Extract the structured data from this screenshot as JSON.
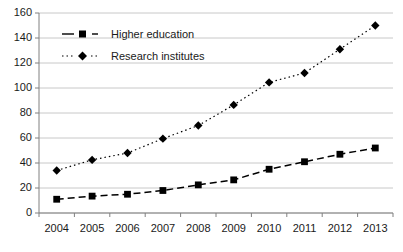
{
  "chart_data": {
    "type": "line",
    "title": "",
    "xlabel": "",
    "ylabel": "",
    "categories": [
      "2004",
      "2005",
      "2006",
      "2007",
      "2008",
      "2009",
      "2010",
      "2011",
      "2012",
      "2013"
    ],
    "series": [
      {
        "name": "Higher education",
        "marker": "square",
        "linestyle": "dashed",
        "color": "#000000",
        "values": [
          11,
          13.5,
          15,
          18,
          22.5,
          26.5,
          35,
          41,
          47,
          52
        ]
      },
      {
        "name": "Research institutes",
        "marker": "diamond",
        "linestyle": "dotted",
        "color": "#000000",
        "values": [
          34,
          42.5,
          48,
          59.5,
          70,
          86.5,
          104.5,
          112,
          131,
          150
        ]
      }
    ],
    "ylim": [
      0,
      160
    ],
    "yticks": [
      0,
      20,
      40,
      60,
      80,
      100,
      120,
      140,
      160
    ],
    "ytick_labels": [
      "0",
      "20",
      "40",
      "60",
      "80",
      "100",
      "120",
      "140",
      "160"
    ],
    "grid": true,
    "grid_axis": "y",
    "grid_color": "#c8c8c8",
    "axis_color": "#808080",
    "legend_position": "upper-left-inside",
    "legend_entries": [
      "Higher education",
      "Research institutes"
    ],
    "background": "#ffffff"
  }
}
